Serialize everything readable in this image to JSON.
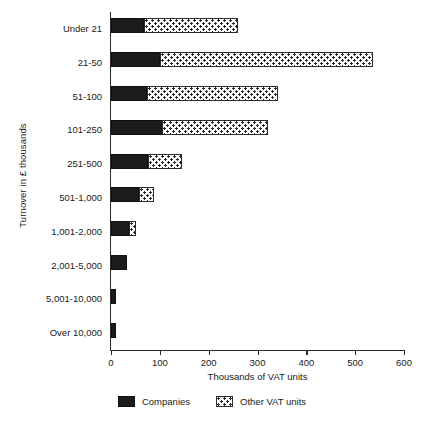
{
  "chart_data": {
    "type": "bar",
    "orientation": "horizontal",
    "stacked": true,
    "title": "",
    "xlabel": "Thousands of VAT units",
    "ylabel": "Turnover in £ thousands",
    "xlim": [
      0,
      600
    ],
    "ylim": null,
    "grid": false,
    "legend_position": "bottom-center",
    "xticks": [
      0,
      100,
      200,
      300,
      400,
      500,
      600
    ],
    "xtick_labels": [
      "0",
      "100",
      "200",
      "300",
      "400",
      "500",
      "600"
    ],
    "categories": [
      "Under 21",
      "21-50",
      "51-100",
      "101-250",
      "251-500",
      "501-1,000",
      "1,001-2,000",
      "2,001-5,000",
      "5,001-10,000",
      "Over 10,000"
    ],
    "series": [
      {
        "name": "Companies",
        "color": "#1c1c1c",
        "pattern": "solid",
        "values": [
          68,
          100,
          74,
          104,
          76,
          58,
          37,
          33,
          10,
          10
        ]
      },
      {
        "name": "Other VAT units",
        "color": "#2b2b2b",
        "pattern": "dotted-hatch",
        "values": [
          192,
          437,
          268,
          218,
          70,
          30,
          14,
          0,
          0,
          0
        ]
      }
    ],
    "totals": [
      260,
      537,
      342,
      322,
      146,
      88,
      51,
      33,
      10,
      10
    ]
  },
  "legend": {
    "items": [
      {
        "label": "Companies",
        "swatch": "solid-black"
      },
      {
        "label": "Other VAT units",
        "swatch": "dotted-hatch"
      }
    ]
  }
}
